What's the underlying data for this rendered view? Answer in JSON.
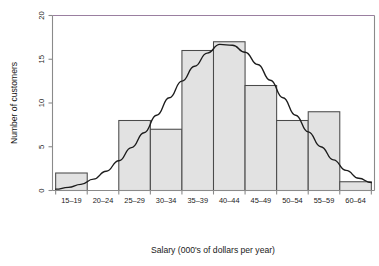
{
  "chart_data": {
    "type": "bar",
    "title": "",
    "subtitle": "",
    "xlabel": "Salary (000's of dollars per year)",
    "ylabel": "Number of customers",
    "categories": [
      "15–19",
      "20–24",
      "25–29",
      "30–34",
      "35–39",
      "40–44",
      "45–49",
      "50–54",
      "55–59",
      "60–64"
    ],
    "values": [
      2,
      0,
      8,
      7,
      16,
      17,
      12,
      8,
      9,
      1
    ],
    "xlim": [
      14.5,
      65.5
    ],
    "ylim": [
      0,
      20
    ],
    "yticks": [
      0,
      5,
      10,
      15,
      20
    ],
    "ytick_labels": [
      "0",
      "5",
      "10",
      "15",
      "20"
    ],
    "grid": false,
    "legend": null,
    "bar_fill_color": "#e2e2e2",
    "bar_edge_color": "#4a4a4a",
    "overlay": {
      "name": "normal-curve",
      "type": "line",
      "description": "fitted normal distribution curve",
      "color": "#1c1c1c",
      "peak_x": 41.0,
      "peak_y": 16.7,
      "mean": 41.0,
      "std_dev": 8.6,
      "points": [
        {
          "x": 15.0,
          "y": 0.15
        },
        {
          "x": 17.0,
          "y": 0.35
        },
        {
          "x": 19.0,
          "y": 0.7
        },
        {
          "x": 21.0,
          "y": 1.3
        },
        {
          "x": 23.0,
          "y": 2.2
        },
        {
          "x": 25.0,
          "y": 3.4
        },
        {
          "x": 27.0,
          "y": 4.9
        },
        {
          "x": 29.0,
          "y": 6.6
        },
        {
          "x": 31.0,
          "y": 8.6
        },
        {
          "x": 33.0,
          "y": 10.6
        },
        {
          "x": 35.0,
          "y": 12.5
        },
        {
          "x": 37.0,
          "y": 14.2
        },
        {
          "x": 39.0,
          "y": 15.7
        },
        {
          "x": 41.0,
          "y": 16.7
        },
        {
          "x": 43.0,
          "y": 16.6
        },
        {
          "x": 45.0,
          "y": 15.8
        },
        {
          "x": 47.0,
          "y": 14.4
        },
        {
          "x": 49.0,
          "y": 12.6
        },
        {
          "x": 51.0,
          "y": 10.6
        },
        {
          "x": 53.0,
          "y": 8.6
        },
        {
          "x": 55.0,
          "y": 6.7
        },
        {
          "x": 57.0,
          "y": 5.0
        },
        {
          "x": 59.0,
          "y": 3.5
        },
        {
          "x": 61.0,
          "y": 2.3
        },
        {
          "x": 63.0,
          "y": 1.4
        },
        {
          "x": 65.0,
          "y": 0.9
        }
      ]
    }
  }
}
